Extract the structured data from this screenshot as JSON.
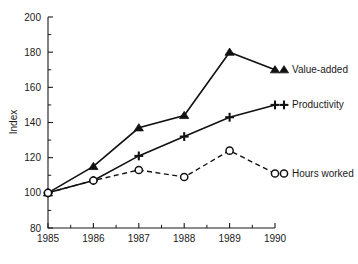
{
  "chart_data": {
    "type": "line",
    "title": "",
    "xlabel": "",
    "ylabel": "Index",
    "categories": [
      "1985",
      "1986",
      "1987",
      "1988",
      "1989",
      "1990"
    ],
    "x": [
      1985,
      1986,
      1987,
      1988,
      1989,
      1990
    ],
    "xlim": [
      1985,
      1990
    ],
    "ylim": [
      80,
      200
    ],
    "y_ticks": [
      80,
      100,
      120,
      140,
      160,
      180,
      200
    ],
    "y_tick_labels": [
      "80",
      "100",
      "120",
      "140",
      "160",
      "180",
      "200"
    ],
    "y_minor_step": 10,
    "grid": false,
    "legend_position": "right-inline",
    "series": [
      {
        "name": "Value-added",
        "marker": "triangle",
        "line_style": "solid",
        "color": "#111111",
        "values": [
          100,
          115,
          137,
          144,
          180,
          170
        ]
      },
      {
        "name": "Productivity",
        "marker": "plus",
        "line_style": "solid",
        "color": "#111111",
        "values": [
          100,
          107,
          121,
          132,
          143,
          150
        ]
      },
      {
        "name": "Hours worked",
        "marker": "circle",
        "line_style": "dashed",
        "color": "#111111",
        "values": [
          100,
          107,
          113,
          109,
          124,
          111
        ]
      }
    ]
  },
  "axes": {
    "y_axis_title": "Index"
  },
  "legend": {
    "items": [
      {
        "label": "Value-added",
        "marker": "triangle"
      },
      {
        "label": "Productivity",
        "marker": "plus"
      },
      {
        "label": "Hours worked",
        "marker": "circle"
      }
    ]
  }
}
